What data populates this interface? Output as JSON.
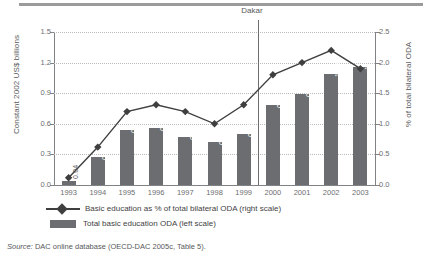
{
  "figure": {
    "source_prefix": "Source:",
    "source_text": " DAC online database (OECD-DAC 2005c, Table 5)."
  },
  "annotation": {
    "dakar_label": "Dakar",
    "dakar_at_year": "2000"
  },
  "legend": {
    "position": "bottom-left",
    "items": [
      {
        "label": "Basic education as % of total bilateral ODA (right scale)",
        "key": "line-diamond",
        "color": "#3f3f3f"
      },
      {
        "label": "Total basic education ODA (left scale)",
        "key": "bar-swatch",
        "color": "#6b6d70"
      }
    ]
  },
  "colors": {
    "bar": "#6b6d70",
    "line": "#3f3f3f",
    "axis": "#808285",
    "grid": "#b9bbbd",
    "text": "#58595b",
    "bar_label": "#ffffff"
  },
  "chart_data": {
    "type": "bar",
    "title": "",
    "xlabel": "",
    "categories": [
      "1993",
      "1994",
      "1995",
      "1996",
      "1997",
      "1998",
      "1999",
      "2000",
      "2001",
      "2002",
      "2003"
    ],
    "grid": true,
    "axes": {
      "left": {
        "label": "Constant 2002 US$ billions",
        "ticks": [
          "0.0",
          "0.3",
          "0.6",
          "0.9",
          "1.2",
          "1.5"
        ],
        "tick_values": [
          0.0,
          0.3,
          0.6,
          0.9,
          1.2,
          1.5
        ],
        "lim": [
          0.0,
          1.5
        ]
      },
      "right": {
        "label": "% of total bilateral ODA",
        "ticks": [
          "0.0",
          "0.5",
          "1.0",
          "1.5",
          "2.0",
          "2.5"
        ],
        "tick_values": [
          0.0,
          0.5,
          1.0,
          1.5,
          2.0,
          2.5
        ],
        "lim": [
          0.0,
          2.5
        ]
      }
    },
    "series": [
      {
        "name": "Total basic education ODA (left scale)",
        "type": "bar",
        "axis": "left",
        "color": "#6b6d70",
        "values": [
          0.04,
          0.27,
          0.54,
          0.56,
          0.47,
          0.42,
          0.5,
          0.78,
          0.89,
          1.09,
          1.16
        ],
        "data_labels": [
          "0.04",
          "0.27",
          "0.54",
          "0.56",
          "0.47",
          "0.42",
          "0.50",
          "0.78",
          "0.89",
          "1.09",
          "1.16"
        ]
      },
      {
        "name": "Basic education as % of total bilateral ODA (right scale)",
        "type": "line",
        "axis": "right",
        "color": "#3f3f3f",
        "marker": "diamond",
        "values": [
          0.12,
          0.62,
          1.2,
          1.31,
          1.2,
          1.0,
          1.31,
          1.8,
          2.0,
          2.2,
          1.9
        ]
      }
    ],
    "annotations": [
      {
        "text": "Dakar",
        "x": "2000",
        "type": "vertical-line"
      }
    ]
  }
}
